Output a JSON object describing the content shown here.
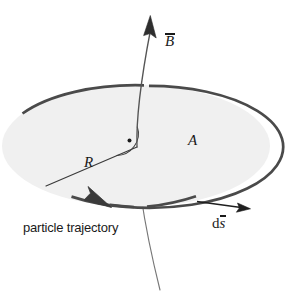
{
  "figure": {
    "kind": "physics-diagram",
    "width": 286,
    "height": 295,
    "background_color": "#ffffff"
  },
  "colors": {
    "stroke_dark": "#4a4a4a",
    "stroke_thin": "#6b6b6b",
    "ink": "#1a1a1a",
    "disk_fill": "#f0f0f0",
    "arrow_fill": "#2e2e2e"
  },
  "labels": {
    "b_field": "B",
    "area": "A",
    "radius": "R",
    "ds_prefix": "d",
    "ds_symbol": "s",
    "trajectory": "particle trajectory"
  },
  "elements": {
    "disk": {
      "name": "area-ellipse",
      "cx": 136,
      "cy": 146,
      "rx": 136,
      "ry": 62,
      "fill": "#f0f0f0",
      "stroke": "#4a4a4a",
      "stroke_width": 2.6
    },
    "b_field_line": {
      "name": "magnetic-field-line",
      "tip_x": 150,
      "tip_y": 16,
      "base_x": 137,
      "base_y": 147,
      "tail_x": 160,
      "tail_y": 288
    },
    "radius_line": {
      "name": "radius-line",
      "x1": 46,
      "y1": 186,
      "x2": 137,
      "y2": 147
    },
    "right_angle_marker": {
      "name": "perpendicular-marker",
      "cx": 137,
      "cy": 147,
      "radius": 21,
      "dot_r": 2.0
    },
    "trajectory_arrow": {
      "name": "trajectory-direction-arrow",
      "tip_x": 103,
      "tip_y": 212
    },
    "ds_arrow": {
      "name": "ds-direction-arrow",
      "x1": 200,
      "y1": 203,
      "x2": 248,
      "y2": 209
    }
  }
}
